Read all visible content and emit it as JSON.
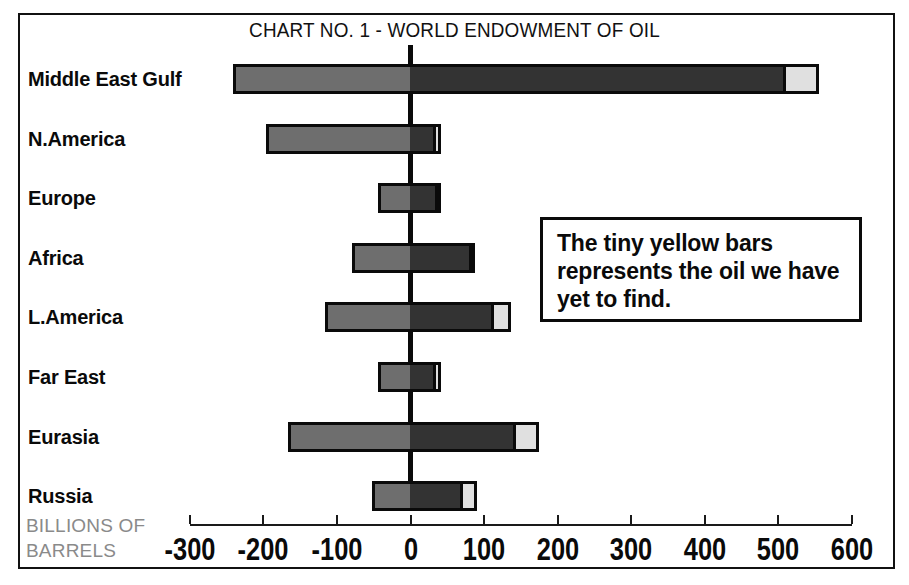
{
  "title": "CHART NO. 1 - WORLD ENDOWMENT OF OIL",
  "axis_caption_line1": "BILLIONS OF",
  "axis_caption_line2": "BARRELS",
  "annotation": "The tiny yellow bars represents the oil we have yet to find.",
  "colors": {
    "produced": "#6e6e6e",
    "remaining": "#333333",
    "yet_to_find": "#e0e0e0",
    "outline": "#0a0a0a",
    "caption": "#8a8a8a"
  },
  "chart_data": {
    "type": "bar",
    "orientation": "horizontal",
    "stacked": true,
    "title": "CHART NO. 1 - WORLD ENDOWMENT OF OIL",
    "xlabel": "BILLIONS OF BARRELS",
    "ylabel": "",
    "xlim": [
      -300,
      600
    ],
    "xticks": [
      -300,
      -200,
      -100,
      0,
      100,
      200,
      300,
      400,
      500,
      600
    ],
    "xticklabels": [
      "-300",
      "-200",
      "-100",
      "0",
      "100",
      "200",
      "300",
      "400",
      "500",
      "600"
    ],
    "grid": false,
    "legend": "The tiny yellow bars represents the oil we have yet to find.",
    "categories": [
      "Middle East Gulf",
      "N.America",
      "Europe",
      "Africa",
      "L.America",
      "Far East",
      "Eurasia",
      "Russia"
    ],
    "series": [
      {
        "name": "Already produced (negative)",
        "color": "#6e6e6e",
        "values": [
          -242,
          -197,
          -44,
          -79,
          -116,
          -44,
          -166,
          -52
        ]
      },
      {
        "name": "Remaining reserves (positive)",
        "color": "#333333",
        "values": [
          506,
          31,
          34,
          79,
          110,
          30,
          140,
          68
        ]
      },
      {
        "name": "Yet to find (yellow)",
        "color": "#e0e0e0",
        "values": [
          49,
          10,
          7,
          9,
          26,
          11,
          35,
          23
        ]
      }
    ],
    "bars": [
      {
        "category": "Middle East Gulf",
        "left": -242,
        "mid": 506,
        "right": 555
      },
      {
        "category": "N.America",
        "left": -197,
        "mid": 31,
        "right": 41
      },
      {
        "category": "Europe",
        "left": -44,
        "mid": 34,
        "right": 41
      },
      {
        "category": "Africa",
        "left": -79,
        "mid": 79,
        "right": 88
      },
      {
        "category": "L.America",
        "left": -116,
        "mid": 110,
        "right": 136
      },
      {
        "category": "Far East",
        "left": -44,
        "mid": 30,
        "right": 41
      },
      {
        "category": "Eurasia",
        "left": -166,
        "mid": 140,
        "right": 175
      },
      {
        "category": "Russia",
        "left": -52,
        "mid": 68,
        "right": 91
      }
    ]
  }
}
